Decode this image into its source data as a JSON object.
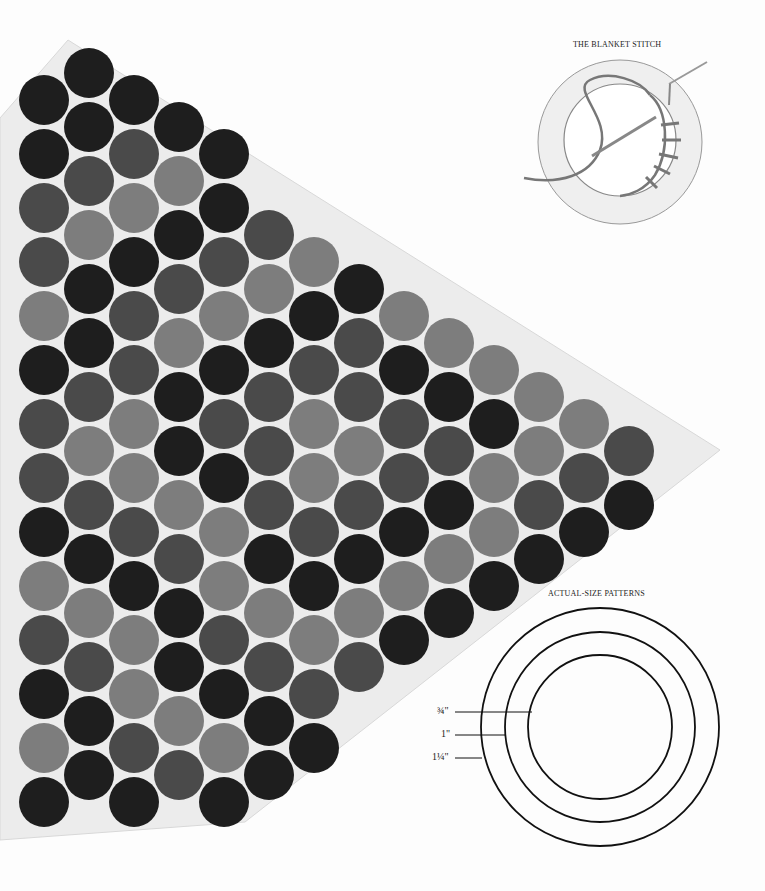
{
  "blanket_stitch": {
    "title": "THE BLANKET STITCH"
  },
  "patterns": {
    "title": "ACTUAL-SIZE PATTERNS",
    "sizes": [
      {
        "label": "¾\""
      },
      {
        "label": "1\""
      },
      {
        "label": "1¼\""
      }
    ]
  },
  "colors": {
    "background": "#fdfdfd",
    "mesh": "#e8e8e8",
    "dark_felt": "#1e1e1e",
    "medium_felt": "#4a4a4a",
    "light_felt": "#7d7d7d",
    "line": "#111111"
  }
}
